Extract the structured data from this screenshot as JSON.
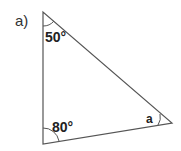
{
  "part_label": "a)",
  "triangle": {
    "vertices": {
      "top": [
        43,
        12
      ],
      "bottom_left": [
        43,
        144
      ],
      "right": [
        172,
        123
      ]
    },
    "angles": {
      "top": "50°",
      "bottom_left": "80°",
      "right": "a"
    },
    "stroke_color": "#555555"
  }
}
